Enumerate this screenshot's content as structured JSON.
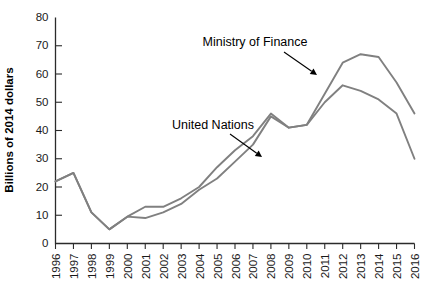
{
  "chart_data": {
    "type": "line",
    "title": "",
    "xlabel": "",
    "ylabel": "Billions of 2014 dollars",
    "ylim": [
      0,
      80
    ],
    "ytick_step": 10,
    "yticks": [
      0,
      10,
      20,
      30,
      40,
      50,
      60,
      70,
      80
    ],
    "grid": false,
    "legend_position": "inline-annotation",
    "x": [
      1996,
      1997,
      1998,
      1999,
      2000,
      2001,
      2002,
      2003,
      2004,
      2005,
      2006,
      2007,
      2008,
      2009,
      2010,
      2011,
      2012,
      2013,
      2014,
      2015,
      2016
    ],
    "categories": [
      "1996",
      "1997",
      "1998",
      "1999",
      "2000",
      "2001",
      "2002",
      "2003",
      "2004",
      "2005",
      "2006",
      "2007",
      "2008",
      "2009",
      "2010",
      "2011",
      "2012",
      "2013",
      "2014",
      "2015",
      "2016"
    ],
    "series": [
      {
        "name": "Ministry of Finance",
        "color": "#808080",
        "values": [
          22,
          25,
          11,
          5,
          9.5,
          13,
          13,
          16,
          20,
          27,
          33,
          38,
          46,
          41,
          42,
          53,
          64,
          67,
          66,
          57,
          46
        ]
      },
      {
        "name": "United Nations",
        "color": "#808080",
        "values": [
          22,
          25,
          11,
          5,
          9.5,
          9,
          11,
          14,
          19,
          23,
          29,
          35,
          45,
          41,
          42,
          50,
          56,
          54,
          51,
          46,
          30
        ]
      }
    ],
    "annotations": [
      {
        "label": "Ministry of Finance",
        "target_year": 2012,
        "target_value": 64
      },
      {
        "label": "United Nations",
        "target_year": 2007,
        "target_value": 35
      }
    ]
  }
}
